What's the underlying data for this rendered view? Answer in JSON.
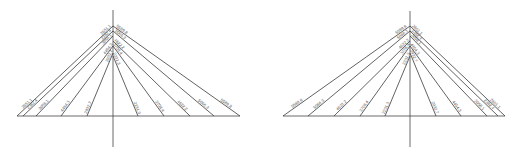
{
  "diagrams": [
    {
      "name": "left-fan-diagram",
      "axis_x": 113,
      "axis_top": 10,
      "axis_bottom": 147,
      "baseline_y": 116,
      "baseline_x0": 17,
      "baseline_x1": 240,
      "lines": [
        {
          "label": "2651.1",
          "bx": 17,
          "ay": 26,
          "side": "left"
        },
        {
          "label": "2382.4",
          "bx": 23,
          "ay": 31,
          "side": "left"
        },
        {
          "label": "3058.1",
          "bx": 36,
          "ay": 36,
          "side": "left"
        },
        {
          "label": "4454.3",
          "bx": 61,
          "ay": 46,
          "side": "left"
        },
        {
          "label": "2932.7",
          "bx": 87,
          "ay": 53,
          "side": "left"
        },
        {
          "label": "2231.3",
          "bx": 138,
          "ay": 56,
          "side": "right"
        },
        {
          "label": "3708.4",
          "bx": 164,
          "ay": 46,
          "side": "right"
        },
        {
          "label": "4622.2",
          "bx": 190,
          "ay": 41,
          "side": "right"
        },
        {
          "label": "5066.3",
          "bx": 214,
          "ay": 31,
          "side": "right"
        },
        {
          "label": "5589.8",
          "bx": 240,
          "ay": 26,
          "side": "right"
        }
      ]
    },
    {
      "name": "right-fan-diagram",
      "axis_x": 410,
      "axis_top": 11,
      "axis_bottom": 147,
      "baseline_y": 116,
      "baseline_x0": 283,
      "baseline_x1": 505,
      "lines": [
        {
          "label": "5589.8",
          "bx": 283,
          "ay": 26,
          "side": "left"
        },
        {
          "label": "5066.3",
          "bx": 308,
          "ay": 31,
          "side": "left"
        },
        {
          "label": "4622.2",
          "bx": 334,
          "ay": 41,
          "side": "left"
        },
        {
          "label": "3708.4",
          "bx": 360,
          "ay": 46,
          "side": "left"
        },
        {
          "label": "2231.3",
          "bx": 385,
          "ay": 56,
          "side": "left"
        },
        {
          "label": "2932.7",
          "bx": 436,
          "ay": 53,
          "side": "right"
        },
        {
          "label": "4454.3",
          "bx": 461,
          "ay": 46,
          "side": "right"
        },
        {
          "label": "3058.1",
          "bx": 487,
          "ay": 36,
          "side": "right"
        },
        {
          "label": "2382.4",
          "bx": 498,
          "ay": 31,
          "side": "right"
        },
        {
          "label": "2651.1",
          "bx": 505,
          "ay": 26,
          "side": "right"
        }
      ]
    }
  ]
}
